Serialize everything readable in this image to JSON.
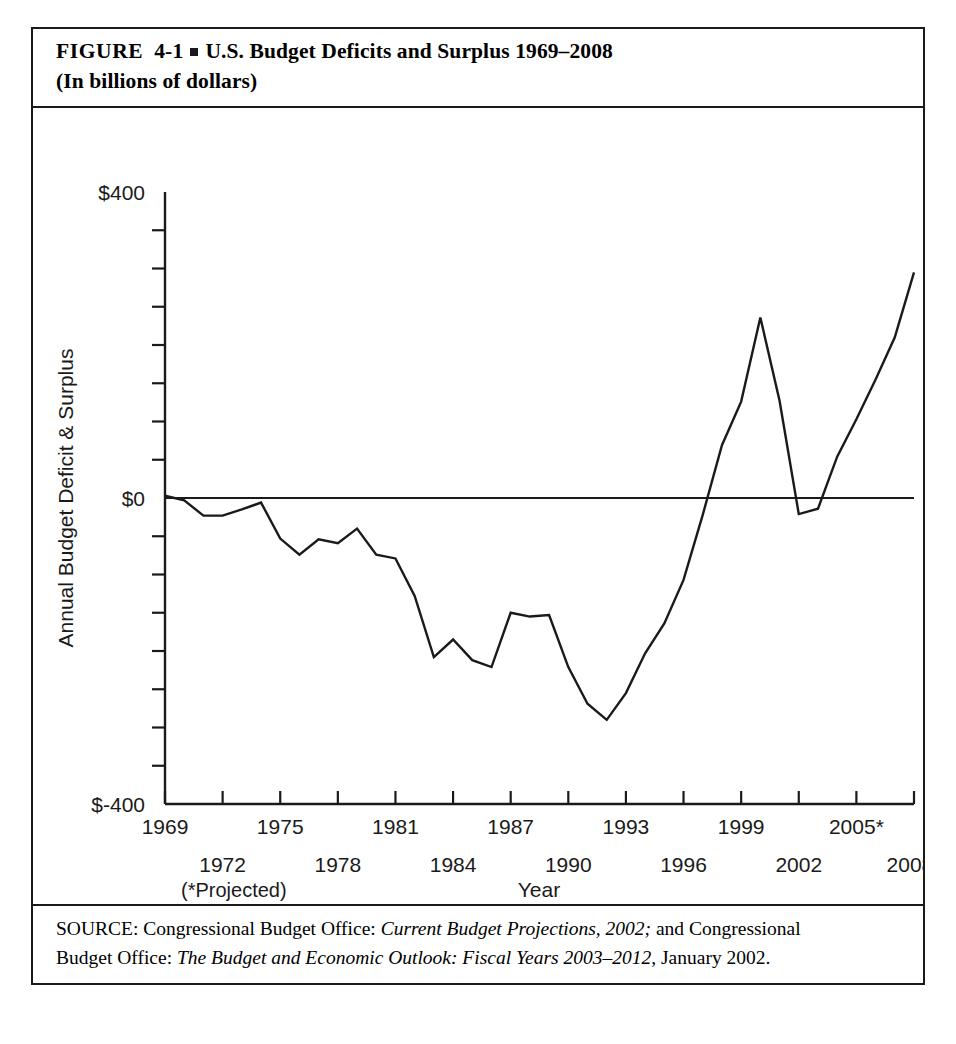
{
  "figure": {
    "label": "FIGURE",
    "number": "4-1",
    "title_line_1": "U.S. Budget Deficits and Surplus 1969–2008",
    "title_line_2": "(In billions of dollars)"
  },
  "source": {
    "line_1_prefix": "SOURCE: Congressional Budget Office: ",
    "line_1_italic": "Current Budget Projections, 2002;",
    "line_1_suffix": " and Congressional",
    "line_2_prefix": "Budget Office: ",
    "line_2_italic": "The Budget and Economic Outlook: Fiscal Years 2003–2012",
    "line_2_suffix": ", January 2002."
  },
  "notes": {
    "projected": "(*Projected)",
    "x_axis_title": "Year"
  },
  "chart_data": {
    "type": "line",
    "title": "U.S. Budget Deficits and Surplus 1969–2008",
    "subtitle": "(In billions of dollars)",
    "xlabel": "Year",
    "ylabel": "Annual Budget Deficit & Surplus",
    "xlim": [
      1969,
      2008
    ],
    "ylim": [
      -400,
      400
    ],
    "grid": false,
    "legend": false,
    "zero_line": true,
    "y_tick_labels": [
      "$400",
      "$0",
      "$-400"
    ],
    "y_tick_values": [
      400,
      0,
      -400
    ],
    "y_minor_tick_step": 50,
    "x_tick_labels_upper": [
      "1969",
      "1975",
      "1981",
      "1987",
      "1993",
      "1999",
      "2005*"
    ],
    "x_tick_values_upper": [
      1969,
      1975,
      1981,
      1987,
      1993,
      1999,
      2005
    ],
    "x_tick_labels_lower": [
      "1972",
      "1978",
      "1984",
      "1990",
      "1996",
      "2002",
      "2008*"
    ],
    "x_tick_values_lower": [
      1972,
      1978,
      1984,
      1990,
      1996,
      2002,
      2008
    ],
    "x": [
      1969,
      1970,
      1971,
      1972,
      1973,
      1974,
      1975,
      1976,
      1977,
      1978,
      1979,
      1980,
      1981,
      1982,
      1983,
      1984,
      1985,
      1986,
      1987,
      1988,
      1989,
      1990,
      1991,
      1992,
      1993,
      1994,
      1995,
      1996,
      1997,
      1998,
      1999,
      2000,
      2001,
      2002,
      2003,
      2004,
      2005,
      2006,
      2007,
      2008
    ],
    "values": [
      3,
      -3,
      -23,
      -23,
      -15,
      -6,
      -53,
      -74,
      -54,
      -59,
      -40,
      -74,
      -79,
      -128,
      -208,
      -185,
      -212,
      -221,
      -150,
      -155,
      -153,
      -221,
      -269,
      -290,
      -255,
      -203,
      -164,
      -107,
      -22,
      69,
      126,
      236,
      127,
      -21,
      -14,
      54,
      103,
      155,
      210,
      295
    ],
    "series_name": "Annual Budget Deficit & Surplus",
    "annotations": [
      "* Projected"
    ],
    "line_color": "#1a1a1a"
  }
}
